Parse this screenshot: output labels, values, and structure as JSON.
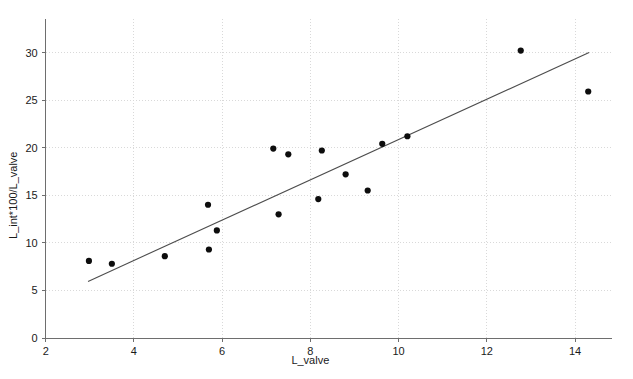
{
  "chart_data": {
    "type": "scatter",
    "title": "",
    "xlabel": "L_valve",
    "ylabel": "L_int*100/L_valve",
    "xlim": [
      2,
      14.85
    ],
    "ylim": [
      0,
      33.5
    ],
    "xticks": [
      2,
      4,
      6,
      8,
      10,
      12,
      14
    ],
    "xtick_labels": [
      "2",
      "4",
      "6",
      "8",
      "10",
      "12",
      "14"
    ],
    "yticks": [
      0,
      5,
      10,
      15,
      20,
      25,
      30
    ],
    "ytick_labels": [
      "0",
      "5",
      "10",
      "15",
      "20",
      "25",
      "30"
    ],
    "grid": true,
    "grid_style": "dotted",
    "legend": "none",
    "points": [
      {
        "x": 2.98,
        "y": 8.1
      },
      {
        "x": 3.5,
        "y": 7.8
      },
      {
        "x": 4.7,
        "y": 8.6
      },
      {
        "x": 5.68,
        "y": 14.0
      },
      {
        "x": 5.7,
        "y": 9.3
      },
      {
        "x": 5.88,
        "y": 11.3
      },
      {
        "x": 7.16,
        "y": 19.9
      },
      {
        "x": 7.28,
        "y": 13.0
      },
      {
        "x": 7.5,
        "y": 19.3
      },
      {
        "x": 8.18,
        "y": 14.6
      },
      {
        "x": 8.26,
        "y": 19.7
      },
      {
        "x": 8.8,
        "y": 17.2
      },
      {
        "x": 9.3,
        "y": 15.5
      },
      {
        "x": 9.63,
        "y": 20.4
      },
      {
        "x": 10.2,
        "y": 21.2
      },
      {
        "x": 12.77,
        "y": 30.2
      },
      {
        "x": 14.3,
        "y": 25.9
      }
    ],
    "fit_line": {
      "type": "linear",
      "x_start": 2.96,
      "y_start": 5.95,
      "x_end": 14.32,
      "y_end": 30.0
    },
    "colors": {
      "point": "#0d0d0d",
      "fit_line": "#4d4d4d",
      "grid": "#d9d9d9",
      "axis": "#6e6e6e",
      "background": "#ffffff",
      "text": "#1a1a1a"
    }
  }
}
